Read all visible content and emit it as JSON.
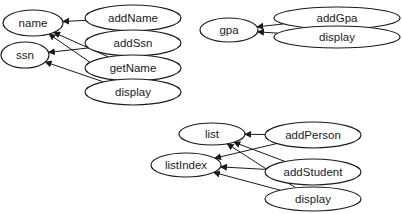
{
  "diagram": {
    "type": "dependency-graph",
    "groups": [
      {
        "id": "person",
        "data_nodes": [
          {
            "id": "name",
            "label": "name",
            "cx": 33,
            "cy": 23,
            "rx": 30,
            "ry": 13
          },
          {
            "id": "ssn",
            "label": "ssn",
            "cx": 25,
            "cy": 55,
            "rx": 24,
            "ry": 13
          }
        ],
        "method_nodes": [
          {
            "id": "addName",
            "label": "addName",
            "cx": 133,
            "cy": 18,
            "rx": 48,
            "ry": 13
          },
          {
            "id": "addSsn",
            "label": "addSsn",
            "cx": 133,
            "cy": 43,
            "rx": 48,
            "ry": 13
          },
          {
            "id": "getName",
            "label": "getName",
            "cx": 133,
            "cy": 68,
            "rx": 48,
            "ry": 13
          },
          {
            "id": "display1",
            "label": "display",
            "cx": 133,
            "cy": 92,
            "rx": 48,
            "ry": 13
          }
        ],
        "edges": [
          {
            "from": "addName",
            "to": "name"
          },
          {
            "from": "addSsn",
            "to": "ssn"
          },
          {
            "from": "getName",
            "to": "name"
          },
          {
            "from": "display1",
            "to": "name"
          },
          {
            "from": "display1",
            "to": "ssn"
          }
        ]
      },
      {
        "id": "student",
        "data_nodes": [
          {
            "id": "gpa",
            "label": "gpa",
            "cx": 229,
            "cy": 30,
            "rx": 29,
            "ry": 12
          }
        ],
        "method_nodes": [
          {
            "id": "addGpa",
            "label": "addGpa",
            "cx": 337,
            "cy": 18,
            "rx": 63,
            "ry": 11
          },
          {
            "id": "display2",
            "label": "display",
            "cx": 337,
            "cy": 37,
            "rx": 63,
            "ry": 11
          }
        ],
        "edges": [
          {
            "from": "addGpa",
            "to": "gpa"
          },
          {
            "from": "display2",
            "to": "gpa"
          }
        ]
      },
      {
        "id": "list",
        "data_nodes": [
          {
            "id": "list",
            "label": "list",
            "cx": 212,
            "cy": 134,
            "rx": 33,
            "ry": 11
          },
          {
            "id": "listIndex",
            "label": "listIndex",
            "cx": 186,
            "cy": 165,
            "rx": 35,
            "ry": 12
          }
        ],
        "method_nodes": [
          {
            "id": "addPerson",
            "label": "addPerson",
            "cx": 313,
            "cy": 135,
            "rx": 48,
            "ry": 13
          },
          {
            "id": "addStudent",
            "label": "addStudent",
            "cx": 313,
            "cy": 172,
            "rx": 48,
            "ry": 13
          },
          {
            "id": "display3",
            "label": "display",
            "cx": 313,
            "cy": 199,
            "rx": 48,
            "ry": 12
          }
        ],
        "edges": [
          {
            "from": "addPerson",
            "to": "list"
          },
          {
            "from": "addPerson",
            "to": "listIndex"
          },
          {
            "from": "addStudent",
            "to": "list"
          },
          {
            "from": "addStudent",
            "to": "listIndex"
          },
          {
            "from": "display3",
            "to": "list"
          },
          {
            "from": "display3",
            "to": "listIndex"
          }
        ]
      }
    ]
  }
}
